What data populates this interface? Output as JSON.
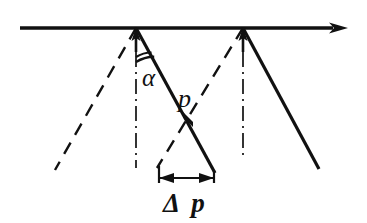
{
  "figure": {
    "background_color": "#ffffff",
    "line_color": "#111111",
    "width": 367,
    "height": 223
  },
  "labels": {
    "alpha": "α",
    "p": "p",
    "delta_p": "Δ p"
  },
  "geometry": {
    "surface_line": {
      "name": "surface-axis",
      "x1": 20,
      "y1": 28,
      "x2": 340,
      "y2": 28,
      "arrow_end": true
    },
    "vertices": [
      {
        "name": "left-vertex",
        "x": 136,
        "y": 28
      },
      {
        "name": "right-vertex",
        "x": 243,
        "y": 28
      }
    ],
    "normals": [
      {
        "name": "left-normal",
        "x": 136,
        "y_top": 28,
        "y_solid_end": 52,
        "y_bottom": 168
      },
      {
        "name": "right-normal",
        "x": 243,
        "y_top": 28,
        "y_solid_end": 52,
        "y_bottom": 160
      }
    ],
    "incident_rays_dashed": [
      {
        "name": "left-incident-ray",
        "x1": 136,
        "y1": 28,
        "x2": 55,
        "y2": 170
      },
      {
        "name": "right-incident-ray",
        "x1": 243,
        "y1": 28,
        "x2": 158,
        "y2": 167
      }
    ],
    "refracted_rays_solid": [
      {
        "name": "left-refracted-ray",
        "x1": 136,
        "y1": 28,
        "x2": 215,
        "y2": 173
      },
      {
        "name": "right-refracted-ray",
        "x1": 243,
        "y1": 28,
        "x2": 319,
        "y2": 169
      }
    ],
    "angle_arc": {
      "name": "alpha-angle-arc",
      "vertex_x": 136,
      "vertex_y": 28,
      "radius_outer": 34,
      "radius_inner": 29
    },
    "intersection_node": {
      "name": "ray-crossing-point",
      "x": 188,
      "y": 122
    },
    "dimension": {
      "name": "delta-p-dimension",
      "y": 178,
      "x_left": 158,
      "x_right": 214,
      "tick_top_left_y": 166,
      "tick_top_right_y": 171
    }
  },
  "label_positions": {
    "alpha": {
      "x": 142,
      "y": 86,
      "size": 25
    },
    "p": {
      "x": 178,
      "y": 107,
      "size": 26
    },
    "delta_p": {
      "x": 163,
      "y": 212,
      "size": 27
    }
  }
}
